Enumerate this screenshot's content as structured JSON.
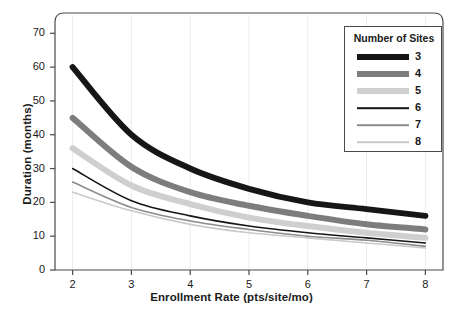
{
  "chart_data": {
    "type": "line",
    "title": "",
    "xlabel": "Enrollment Rate (pts/site/mo)",
    "ylabel": "Duration (months)",
    "x": [
      2,
      3,
      4,
      5,
      6,
      7,
      8
    ],
    "xlim": [
      1.7,
      8.3
    ],
    "ylim": [
      0,
      76
    ],
    "xticks": [
      2,
      3,
      4,
      5,
      6,
      7,
      8
    ],
    "yticks": [
      0,
      10,
      20,
      30,
      40,
      50,
      60,
      70
    ],
    "xticklabels": [
      "2",
      "3",
      "4",
      "5",
      "6",
      "7",
      "8"
    ],
    "yticklabels": [
      "0",
      "10",
      "20",
      "30",
      "40",
      "50",
      "60",
      "70"
    ],
    "grid": "vertical-faint",
    "legend_position": "upper-right",
    "legend_title": "Number of Sites",
    "series": [
      {
        "name": "3",
        "values": [
          60,
          40,
          30,
          24,
          20,
          18,
          16
        ],
        "color": "#161616",
        "width": 6
      },
      {
        "name": "4",
        "values": [
          45,
          30.5,
          23,
          19,
          16,
          13.5,
          12
        ],
        "color": "#7d7d7d",
        "width": 6
      },
      {
        "name": "5",
        "values": [
          36,
          25,
          19.5,
          15.5,
          13,
          11,
          9.5
        ],
        "color": "#cfcfcf",
        "width": 6
      },
      {
        "name": "6",
        "values": [
          30,
          20.5,
          16,
          13,
          11,
          9.5,
          8
        ],
        "color": "#161616",
        "width": 1.6
      },
      {
        "name": "7",
        "values": [
          26,
          18.5,
          14.5,
          12,
          10,
          8.8,
          7
        ],
        "color": "#8c8c8c",
        "width": 1.6
      },
      {
        "name": "8",
        "values": [
          23,
          17.5,
          13.5,
          11,
          9.5,
          8,
          6.5
        ],
        "color": "#c9c9c9",
        "width": 1.6
      }
    ]
  },
  "axes": {
    "x_title": "Enrollment Rate (pts/site/mo)",
    "y_title": "Duration (months)"
  },
  "legend": {
    "title": "Number of Sites",
    "entries": [
      {
        "label": "3"
      },
      {
        "label": "4"
      },
      {
        "label": "5"
      },
      {
        "label": "6"
      },
      {
        "label": "7"
      },
      {
        "label": "8"
      }
    ]
  },
  "colors": {
    "frame": "#4a4a4a",
    "grid": "#ececec",
    "text": "#1a1a1a",
    "background": "#ffffff"
  }
}
